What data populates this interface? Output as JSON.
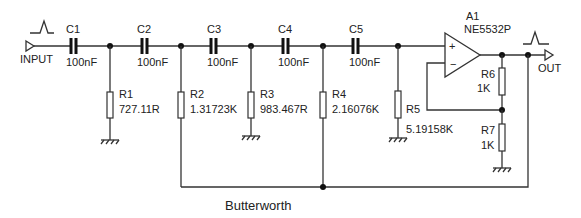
{
  "title": "Butterworth",
  "io": {
    "input_label": "INPUT",
    "output_label": "OUT"
  },
  "opamp": {
    "ref": "A1",
    "part": "NE5532P",
    "plus": "+",
    "minus": "−"
  },
  "capacitors": [
    {
      "ref": "C1",
      "value": "100nF"
    },
    {
      "ref": "C2",
      "value": "100nF"
    },
    {
      "ref": "C3",
      "value": "100nF"
    },
    {
      "ref": "C4",
      "value": "100nF"
    },
    {
      "ref": "C5",
      "value": "100nF"
    }
  ],
  "resistors": [
    {
      "ref": "R1",
      "value": "727.11R"
    },
    {
      "ref": "R2",
      "value": "1.31723K"
    },
    {
      "ref": "R3",
      "value": "983.467R"
    },
    {
      "ref": "R4",
      "value": "2.16076K"
    },
    {
      "ref": "R5",
      "value": "5.19158K"
    },
    {
      "ref": "R6",
      "value": "1K"
    },
    {
      "ref": "R7",
      "value": "1K"
    }
  ],
  "colors": {
    "wire": "#333333",
    "text": "#222222",
    "background": "#ffffff"
  }
}
